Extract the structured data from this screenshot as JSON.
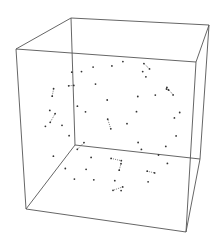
{
  "figure": {
    "kind": "3d-wireframe-polyhedron",
    "box_visible": true,
    "edge_style": "dotted",
    "vertex_markers": true,
    "colors": {
      "background": "#ffffff",
      "box": "#555555",
      "edges": "#444444",
      "vertices": "#333333"
    }
  }
}
